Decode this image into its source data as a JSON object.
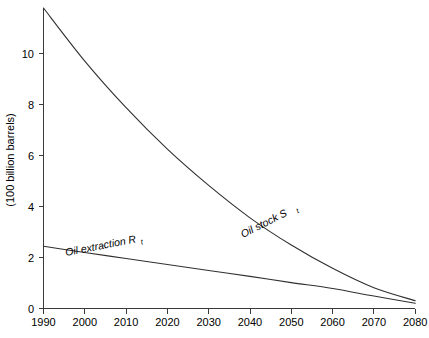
{
  "chart_data": {
    "type": "line",
    "title": "",
    "subtitle": "",
    "xlabel": "",
    "ylabel": "(100 billion barrels)",
    "xlim": [
      1990,
      2080
    ],
    "ylim": [
      0,
      11.6
    ],
    "grid": false,
    "legend_position": "inline-curve-labels",
    "x_ticks": [
      "1990",
      "2000",
      "2010",
      "2020",
      "2030",
      "2040",
      "2050",
      "2060",
      "2070",
      "2080"
    ],
    "x_tick_values": [
      1990,
      2000,
      2010,
      2020,
      2030,
      2040,
      2050,
      2060,
      2070,
      2080
    ],
    "y_ticks": [
      "0",
      "2",
      "4",
      "6",
      "8",
      "10"
    ],
    "y_tick_values": [
      0,
      2,
      4,
      6,
      8,
      10
    ],
    "x": [
      1990,
      2000,
      2010,
      2020,
      2030,
      2040,
      2050,
      2060,
      2070,
      2080
    ],
    "series": [
      {
        "name": "Oil stock S",
        "label_text": "Oil stock S",
        "label_subscript": "t",
        "values": [
          11.6,
          9.55,
          7.75,
          6.15,
          4.75,
          3.5,
          2.45,
          1.55,
          0.8,
          0.3
        ]
      },
      {
        "name": "Oil extraction R",
        "label_text": "Oil extraction R",
        "label_subscript": "t",
        "values": [
          2.4,
          2.16,
          1.93,
          1.7,
          1.47,
          1.24,
          1.0,
          0.77,
          0.48,
          0.2
        ]
      }
    ],
    "colors": {
      "curve": "#303030",
      "axis": "#3a3a3a",
      "background": "#ffffff",
      "text": "#000000"
    }
  },
  "axes": {
    "y_axis_title": "(100 billion barrels)",
    "x_tick_labels": [
      "1990",
      "2000",
      "2010",
      "2020",
      "2030",
      "2040",
      "2050",
      "2060",
      "2070",
      "2080"
    ],
    "y_tick_labels": [
      "10",
      "8",
      "6",
      "4",
      "2",
      "0"
    ]
  },
  "labels": {
    "stock_main": "Oil stock S",
    "stock_sub": "t",
    "extraction_main": "Oil extraction R",
    "extraction_sub": "t"
  }
}
